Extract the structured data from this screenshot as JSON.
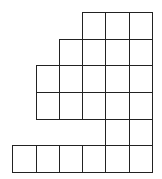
{
  "diagram": {
    "type": "young-diagram",
    "line_color": "#222222",
    "cell_size": 23.5,
    "column_edges_x": [
      12,
      36,
      59,
      82,
      105,
      129,
      152
    ],
    "row_edges_y": [
      12,
      39,
      65,
      92,
      119,
      145,
      172
    ],
    "rows": [
      {
        "row": 1,
        "start_col": 3,
        "cell_count": 3
      },
      {
        "row": 2,
        "start_col": 2,
        "cell_count": 4
      },
      {
        "row": 3,
        "start_col": 1,
        "cell_count": 5
      },
      {
        "row": 4,
        "start_col": 1,
        "cell_count": 5
      },
      {
        "row": 5,
        "start_col": 4,
        "cell_count": 2
      },
      {
        "row": 6,
        "start_col": 0,
        "cell_count": 6
      }
    ]
  }
}
